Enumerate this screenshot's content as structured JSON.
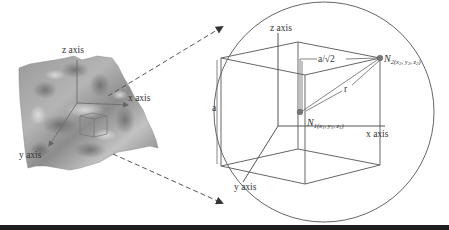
{
  "figure": {
    "left_panel": {
      "description": "3D terrain surface with coordinate axes and small cube",
      "labels": {
        "z_axis": "z axis",
        "x_axis": "x axis",
        "y_axis": "y axis"
      }
    },
    "right_panel": {
      "description": "Enlarged cube inscribed in sphere",
      "labels": {
        "z_axis": "z axis",
        "x_axis": "x axis",
        "y_axis": "y axis",
        "edge": "a",
        "half_diag": "a/√2",
        "radius": "r",
        "n1_main": "N",
        "n1_sub": "1(x",
        "n1_rest": "1",
        "n1_y": ", y",
        "n1_y_sub": "1",
        "n1_z": ", z",
        "n1_z_sub": "1",
        "n1_close": ")",
        "n2_main": "N",
        "n2_sub": "2(x",
        "n2_x_sub": "2",
        "n2_y": ", y",
        "n2_y_sub": "2",
        "n2_z": ", z",
        "n2_z_sub": "2",
        "n2_close": ")"
      }
    },
    "colors": {
      "line": "#555555",
      "terrain_dark": "#6a6a6a",
      "terrain_light": "#c8c8c8",
      "bar": "#1e1e1e"
    }
  }
}
